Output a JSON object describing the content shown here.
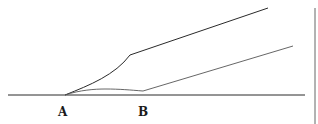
{
  "diagram": {
    "labels": {
      "point_a": "A",
      "point_b": "B"
    },
    "colors": {
      "background": "#ffffff",
      "line": "#2a2a2a"
    }
  }
}
